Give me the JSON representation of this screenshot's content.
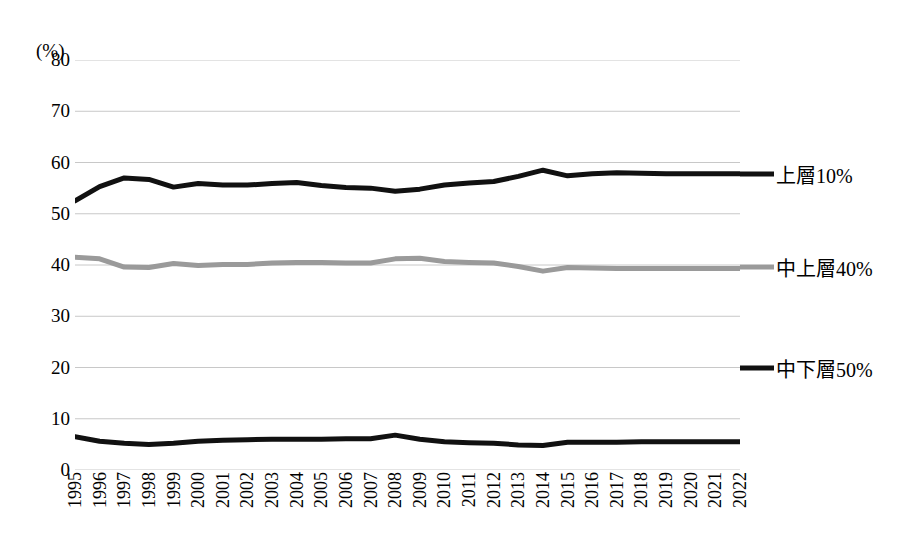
{
  "chart_data": {
    "type": "line",
    "title": "",
    "subtitle": "",
    "xlabel": "",
    "ylabel": "(%)",
    "unit_label": "(%)",
    "grid": true,
    "legend_position": "right",
    "ylim": [
      0,
      80
    ],
    "yticks": [
      0,
      10,
      20,
      30,
      40,
      50,
      60,
      70,
      80
    ],
    "ytick_labels": [
      "0",
      "10",
      "20",
      "30",
      "40",
      "50",
      "60",
      "70",
      "80"
    ],
    "categories": [
      "1995",
      "1996",
      "1997",
      "1998",
      "1999",
      "2000",
      "2001",
      "2002",
      "2003",
      "2004",
      "2005",
      "2006",
      "2007",
      "2008",
      "2009",
      "2010",
      "2011",
      "2012",
      "2013",
      "2014",
      "2015",
      "2016",
      "2017",
      "2018",
      "2019",
      "2020",
      "2021",
      "2022"
    ],
    "series": [
      {
        "name": "上層10%",
        "color": "#111111",
        "width": 5,
        "values": [
          52.5,
          55.3,
          57.0,
          56.7,
          55.2,
          55.9,
          55.6,
          55.6,
          55.9,
          56.1,
          55.5,
          55.1,
          55.0,
          54.4,
          54.8,
          55.6,
          56.0,
          56.3,
          57.3,
          58.5,
          57.4,
          57.8,
          58.0,
          57.9,
          57.8,
          57.8,
          57.8,
          57.8
        ]
      },
      {
        "name": "中上層40%",
        "color": "#9a9a9a",
        "width": 5,
        "values": [
          41.5,
          41.2,
          39.6,
          39.5,
          40.3,
          39.9,
          40.1,
          40.1,
          40.4,
          40.5,
          40.5,
          40.4,
          40.4,
          41.2,
          41.3,
          40.7,
          40.5,
          40.4,
          39.7,
          38.8,
          39.5,
          39.4,
          39.3,
          39.3,
          39.3,
          39.3,
          39.3,
          39.3
        ]
      },
      {
        "name": "中下層50%",
        "color": "#111111",
        "width": 5,
        "values": [
          6.5,
          5.6,
          5.2,
          5.0,
          5.2,
          5.6,
          5.8,
          5.9,
          6.0,
          6.0,
          6.0,
          6.1,
          6.1,
          6.8,
          6.0,
          5.5,
          5.3,
          5.2,
          4.9,
          4.8,
          5.4,
          5.4,
          5.4,
          5.5,
          5.5,
          5.5,
          5.5,
          5.5
        ]
      }
    ],
    "legend": [
      {
        "label": "上層10%",
        "color": "#111111",
        "value_at_label": 57.8
      },
      {
        "label": "中上層40%",
        "color": "#9a9a9a",
        "value_at_label": 39.6
      },
      {
        "label": "中下層50%",
        "color": "#111111",
        "value_at_label": 20.0
      }
    ]
  }
}
